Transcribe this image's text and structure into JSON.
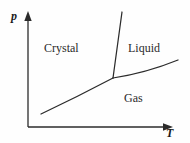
{
  "figure": {
    "kind": "phase-diagram",
    "width": 190,
    "height": 143,
    "background_color": "#fefefe",
    "line_color": "#2b2b2b"
  },
  "axes": {
    "y_axis": {
      "label": "p",
      "name": "pressure",
      "x": 28,
      "y_top": 14,
      "y_bottom": 127,
      "arrow": "up"
    },
    "x_axis": {
      "label": "T",
      "name": "temperature",
      "y": 127,
      "x_left": 28,
      "x_right": 172,
      "arrow": "right"
    }
  },
  "regions": [
    {
      "label": "Crystal",
      "name": "crystal-region",
      "x": 44,
      "y": 42
    },
    {
      "label": "Liquid",
      "name": "liquid-region",
      "x": 128,
      "y": 42
    },
    {
      "label": "Gas",
      "name": "gas-region",
      "x": 124,
      "y": 92
    }
  ],
  "triple_point": {
    "x": 113,
    "y": 78
  },
  "curves": [
    {
      "name": "sublimation-curve",
      "boundary": "crystal-gas",
      "path": "M 41 114 Q 77 97 113 78"
    },
    {
      "name": "melting-curve",
      "boundary": "crystal-liquid",
      "path": "M 113 78 C 115 62 118 40 122 12"
    },
    {
      "name": "vaporization-curve",
      "boundary": "liquid-gas",
      "path": "M 113 78 Q 146 73 178 60"
    }
  ],
  "chart_data": {
    "type": "line",
    "title": "",
    "xlabel": "T",
    "ylabel": "p",
    "xlim": [
      28,
      172
    ],
    "ylim": [
      127,
      14
    ],
    "grid": false,
    "legend": "none",
    "annotations": [
      "Crystal",
      "Liquid",
      "Gas"
    ],
    "series": [
      {
        "name": "Sublimation curve (crystal–gas)",
        "points": [
          [
            41,
            114
          ],
          [
            59,
            105
          ],
          [
            77,
            96
          ],
          [
            95,
            87
          ],
          [
            113,
            78
          ]
        ]
      },
      {
        "name": "Melting curve (crystal–liquid)",
        "points": [
          [
            113,
            78
          ],
          [
            114,
            65
          ],
          [
            116,
            52
          ],
          [
            118,
            38
          ],
          [
            120,
            25
          ],
          [
            122,
            12
          ]
        ]
      },
      {
        "name": "Vaporization curve (liquid–gas)",
        "points": [
          [
            113,
            78
          ],
          [
            129,
            75
          ],
          [
            146,
            71
          ],
          [
            162,
            66
          ],
          [
            178,
            60
          ]
        ]
      }
    ]
  }
}
